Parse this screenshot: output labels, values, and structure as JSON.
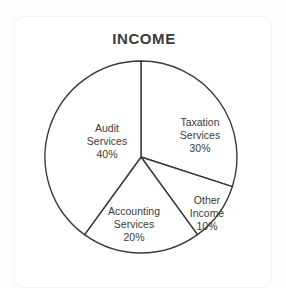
{
  "card": {
    "title": "INCOME",
    "background": "#ffffff",
    "border_color": "#f1f1f3"
  },
  "page": {
    "background": "#fdfdfe",
    "text_color": "#3b3b3d"
  },
  "chart_data": {
    "type": "pie",
    "title": "INCOME",
    "xlabel": "",
    "ylabel": "",
    "legend": "none",
    "grid": false,
    "start_angle_deg": 0,
    "direction": "clockwise",
    "stroke_color": "#3a3a3c",
    "slice_fill": "#ffffff",
    "categories": [
      "Taxation Services",
      "Other Income",
      "Accounting Services",
      "Audit Services"
    ],
    "values": [
      30,
      10,
      20,
      40
    ],
    "unit": "%",
    "slices": [
      {
        "name": "Taxation Services",
        "value": 30,
        "value_label": "30%",
        "label_lines": [
          "Taxation",
          "Services",
          "30%"
        ],
        "start_deg": 0,
        "end_deg": 108
      },
      {
        "name": "Other Income",
        "value": 10,
        "value_label": "10%",
        "label_lines": [
          "Other",
          "Income",
          "10%"
        ],
        "start_deg": 108,
        "end_deg": 144
      },
      {
        "name": "Accounting Services",
        "value": 20,
        "value_label": "20%",
        "label_lines": [
          "Accounting",
          "Services",
          "20%"
        ],
        "start_deg": 144,
        "end_deg": 216
      },
      {
        "name": "Audit Services",
        "value": 40,
        "value_label": "40%",
        "label_lines": [
          "Audit",
          "Services",
          "40%"
        ],
        "start_deg": 216,
        "end_deg": 360
      }
    ]
  }
}
